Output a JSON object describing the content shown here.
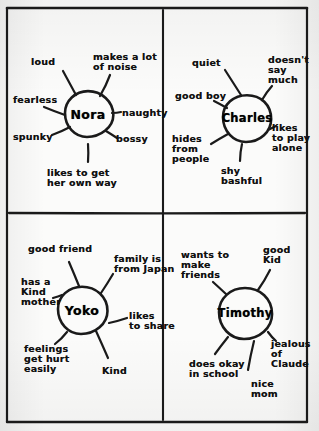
{
  "worksheet": {
    "title": "Character trait webs",
    "layout": "2x2 grid of character webs",
    "border_color": "#1a1a1a",
    "ink_color": "#101010",
    "paper_color": "#fbfbfa"
  },
  "frame": {
    "outer": {
      "x": 7,
      "y": 8,
      "w": 300,
      "h": 414
    },
    "divider_vertical_x": 163,
    "divider_horizontal_y": 213
  },
  "webs": [
    {
      "id": "nora",
      "center_label": "Nora",
      "quadrant": "top-left",
      "circle": {
        "cx": 88,
        "cy": 114,
        "r": 23
      },
      "traits": [
        {
          "text": "loud",
          "x": 31,
          "y": 57,
          "align": "left",
          "spoke": {
            "x1": 63,
            "y1": 71,
            "x2": 76,
            "y2": 95
          }
        },
        {
          "text": "makes a lot\nof noise",
          "x": 93,
          "y": 52,
          "align": "left",
          "spoke": {
            "x1": 110,
            "y1": 75,
            "x2": 100,
            "y2": 96
          }
        },
        {
          "text": "fearless",
          "x": 13,
          "y": 95,
          "align": "left",
          "spoke": {
            "x1": 44,
            "y1": 107,
            "x2": 65,
            "y2": 115
          }
        },
        {
          "text": "naughty",
          "x": 122,
          "y": 108,
          "align": "left",
          "spoke": {
            "x1": 112,
            "y1": 113,
            "x2": 121,
            "y2": 112
          }
        },
        {
          "text": "spunky",
          "x": 13,
          "y": 132,
          "align": "left",
          "spoke": {
            "x1": 52,
            "y1": 135,
            "x2": 70,
            "y2": 127
          }
        },
        {
          "text": "bossy",
          "x": 116,
          "y": 134,
          "align": "left",
          "spoke": {
            "x1": 106,
            "y1": 131,
            "x2": 117,
            "y2": 138
          }
        },
        {
          "text": "likes to get\nher own way",
          "x": 47,
          "y": 168,
          "align": "left",
          "spoke": {
            "x1": 88,
            "y1": 144,
            "x2": 88,
            "y2": 162
          }
        }
      ]
    },
    {
      "id": "charles",
      "center_label": "Charles",
      "quadrant": "top-right",
      "circle": {
        "cx": 247,
        "cy": 118,
        "r": 24
      },
      "traits": [
        {
          "text": "quiet",
          "x": 192,
          "y": 58,
          "align": "left",
          "spoke": {
            "x1": 225,
            "y1": 70,
            "x2": 241,
            "y2": 95
          }
        },
        {
          "text": "doesn't\nsay\nmuch",
          "x": 268,
          "y": 55,
          "align": "left",
          "spoke": {
            "x1": 272,
            "y1": 86,
            "x2": 262,
            "y2": 100
          }
        },
        {
          "text": "good boy",
          "x": 175,
          "y": 91,
          "align": "left",
          "spoke": {
            "x1": 214,
            "y1": 101,
            "x2": 227,
            "y2": 108
          }
        },
        {
          "text": "likes\nto play\nalone",
          "x": 272,
          "y": 123,
          "align": "left",
          "spoke": {
            "x1": 268,
            "y1": 130,
            "x2": 276,
            "y2": 126
          }
        },
        {
          "text": "hides\nfrom\npeople",
          "x": 172,
          "y": 134,
          "align": "left",
          "spoke": {
            "x1": 211,
            "y1": 144,
            "x2": 228,
            "y2": 134
          }
        },
        {
          "text": "shy\nbashful",
          "x": 221,
          "y": 166,
          "align": "left",
          "spoke": {
            "x1": 242,
            "y1": 144,
            "x2": 240,
            "y2": 161
          }
        }
      ]
    },
    {
      "id": "yoko",
      "center_label": "Yoko",
      "quadrant": "bottom-left",
      "circle": {
        "cx": 82,
        "cy": 310,
        "r": 24
      },
      "traits": [
        {
          "text": "good friend",
          "x": 28,
          "y": 244,
          "align": "left",
          "spoke": {
            "x1": 69,
            "y1": 262,
            "x2": 79,
            "y2": 286
          }
        },
        {
          "text": "family is\nfrom Japan",
          "x": 114,
          "y": 254,
          "align": "left",
          "spoke": {
            "x1": 113,
            "y1": 274,
            "x2": 101,
            "y2": 293
          }
        },
        {
          "text": "has a\nKind\nmother",
          "x": 21,
          "y": 277,
          "align": "left",
          "spoke": {
            "x1": 53,
            "y1": 298,
            "x2": 62,
            "y2": 295
          }
        },
        {
          "text": "likes\nto share",
          "x": 129,
          "y": 311,
          "align": "left",
          "spoke": {
            "x1": 109,
            "y1": 323,
            "x2": 127,
            "y2": 318
          }
        },
        {
          "text": "feelings\nget hurt\neasily",
          "x": 24,
          "y": 344,
          "align": "left",
          "spoke": {
            "x1": 67,
            "y1": 332,
            "x2": 55,
            "y2": 344
          }
        },
        {
          "text": "Kind",
          "x": 102,
          "y": 366,
          "align": "left",
          "spoke": {
            "x1": 96,
            "y1": 331,
            "x2": 108,
            "y2": 358
          }
        }
      ]
    },
    {
      "id": "timothy",
      "center_label": "Timothy",
      "quadrant": "bottom-right",
      "circle": {
        "cx": 245,
        "cy": 313,
        "r": 26
      },
      "traits": [
        {
          "text": "wants to\nmake\nfriends",
          "x": 181,
          "y": 250,
          "align": "left",
          "spoke": {
            "x1": 213,
            "y1": 282,
            "x2": 226,
            "y2": 294
          }
        },
        {
          "text": "good\nKid",
          "x": 263,
          "y": 245,
          "align": "left",
          "spoke": {
            "x1": 270,
            "y1": 270,
            "x2": 258,
            "y2": 290
          }
        },
        {
          "text": "jealous\nof\nClaude",
          "x": 271,
          "y": 339,
          "align": "left",
          "spoke": {
            "x1": 268,
            "y1": 332,
            "x2": 276,
            "y2": 341
          }
        },
        {
          "text": "does okay\nin school",
          "x": 189,
          "y": 359,
          "align": "left",
          "spoke": {
            "x1": 228,
            "y1": 337,
            "x2": 215,
            "y2": 354
          }
        },
        {
          "text": "nice\nmom",
          "x": 251,
          "y": 379,
          "align": "left",
          "spoke": {
            "x1": 254,
            "y1": 341,
            "x2": 248,
            "y2": 370
          }
        }
      ]
    }
  ]
}
